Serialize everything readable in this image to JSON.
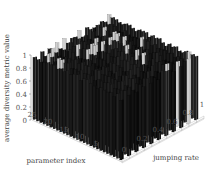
{
  "chart_data": {
    "type": "bar3d",
    "title": "",
    "zlabel": "average diversity metric value",
    "xlabel": "parameter index",
    "ylabel": "jumping rate",
    "zlim": [
      0,
      1
    ],
    "z_ticks": [
      "0",
      "0.2",
      "0.4",
      "0.6",
      "0.8",
      "1"
    ],
    "x_ticks": [
      "5",
      "10",
      "15",
      "20",
      "25"
    ],
    "y_ticks": [
      "0",
      "0.2",
      "0.4",
      "0.6",
      "0.8",
      "1"
    ],
    "x_range": [
      1,
      27
    ],
    "y_values": [
      0,
      0.1,
      0.2,
      0.3,
      0.4,
      0.5,
      0.6,
      0.7,
      0.8,
      0.9,
      1.0
    ],
    "grid": false,
    "colormap": "gray",
    "note": "Most bars near 1.0 (dark); a few bars at the back row appear lighter gray with slightly higher values",
    "values_summary": {
      "typical": 0.95,
      "max": 1.0,
      "min": 0.9
    }
  }
}
